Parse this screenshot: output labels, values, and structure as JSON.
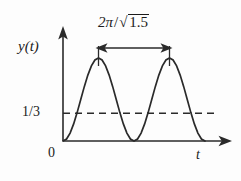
{
  "figure": {
    "title": "",
    "background_color": "#fdfdfd",
    "line_color": "#2a2a2a"
  },
  "axes": {
    "y_axis_label": "y(t)",
    "x_axis_label": "t",
    "origin_label": "0"
  },
  "annotations": {
    "threshold_label": "1/3",
    "period_numerator": "2π",
    "period_slash": "/",
    "period_radical_sign": "√",
    "period_radicand": "1.5",
    "period_label_full": "2π / √1.5"
  },
  "chart_data": {
    "type": "line",
    "title": "",
    "xlabel": "t",
    "ylabel": "y(t)",
    "xlim": [
      0,
      2.3
    ],
    "ylim": [
      0,
      1.15
    ],
    "grid": false,
    "legend": null,
    "series": [
      {
        "name": "y(t)",
        "description": "Non-negative periodic oscillation (sine-squared shape) touching zero at t = 0, 1, 2 with unit-height peaks at t = 0.5 and t = 1.5",
        "x": [
          0.0,
          0.05,
          0.1,
          0.15,
          0.2,
          0.25,
          0.3,
          0.35,
          0.4,
          0.45,
          0.5,
          0.55,
          0.6,
          0.65,
          0.7,
          0.75,
          0.8,
          0.85,
          0.9,
          0.95,
          1.0,
          1.05,
          1.1,
          1.15,
          1.2,
          1.25,
          1.3,
          1.35,
          1.4,
          1.45,
          1.5,
          1.55,
          1.6,
          1.65,
          1.7,
          1.75,
          1.8,
          1.85,
          1.9,
          1.95,
          2.0
        ],
        "y": [
          0.0,
          0.024,
          0.095,
          0.206,
          0.345,
          0.5,
          0.655,
          0.794,
          0.905,
          0.976,
          1.0,
          0.976,
          0.905,
          0.794,
          0.655,
          0.5,
          0.345,
          0.206,
          0.095,
          0.024,
          0.0,
          0.024,
          0.095,
          0.206,
          0.345,
          0.5,
          0.655,
          0.794,
          0.905,
          0.976,
          1.0,
          0.976,
          0.905,
          0.794,
          0.655,
          0.5,
          0.345,
          0.206,
          0.095,
          0.024,
          0.0
        ]
      }
    ],
    "reference_lines": [
      {
        "name": "threshold",
        "orientation": "horizontal",
        "value": 0.3333,
        "label": "1/3",
        "style": "dashed"
      }
    ],
    "measurements": [
      {
        "name": "period",
        "from_x": 0.5,
        "to_x": 1.5,
        "value": 1.0,
        "label": "2π / √1.5",
        "style": "double-headed-arrow"
      }
    ]
  }
}
